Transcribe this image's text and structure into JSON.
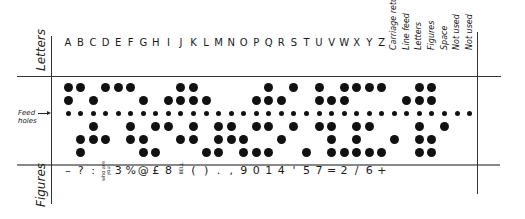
{
  "labels": {
    "letters": "Letters",
    "figures": "Figures",
    "feed_holes": "Feed holes"
  },
  "columns": [
    {
      "letter": "A",
      "figure": "–",
      "holes": [
        1,
        1,
        0,
        0,
        0
      ]
    },
    {
      "letter": "B",
      "figure": "?",
      "holes": [
        1,
        0,
        0,
        1,
        1
      ]
    },
    {
      "letter": "C",
      "figure": ":",
      "holes": [
        0,
        1,
        1,
        1,
        0
      ]
    },
    {
      "letter": "D",
      "figure": "who are you",
      "holes": [
        1,
        0,
        0,
        1,
        0
      ]
    },
    {
      "letter": "E",
      "figure": "3",
      "holes": [
        1,
        0,
        0,
        0,
        0
      ]
    },
    {
      "letter": "F",
      "figure": "%",
      "holes": [
        1,
        0,
        1,
        1,
        0
      ]
    },
    {
      "letter": "G",
      "figure": "@",
      "holes": [
        0,
        1,
        0,
        1,
        1
      ]
    },
    {
      "letter": "H",
      "figure": "£",
      "holes": [
        0,
        0,
        1,
        0,
        1
      ]
    },
    {
      "letter": "I",
      "figure": "8",
      "holes": [
        0,
        1,
        1,
        0,
        0
      ]
    },
    {
      "letter": "J",
      "figure": "BELL",
      "holes": [
        1,
        1,
        0,
        1,
        0
      ]
    },
    {
      "letter": "K",
      "figure": "(",
      "holes": [
        1,
        1,
        1,
        1,
        0
      ]
    },
    {
      "letter": "L",
      "figure": ")",
      "holes": [
        0,
        1,
        0,
        0,
        1
      ]
    },
    {
      "letter": "M",
      "figure": ".",
      "holes": [
        0,
        0,
        1,
        1,
        1
      ]
    },
    {
      "letter": "N",
      "figure": ",",
      "holes": [
        0,
        0,
        1,
        1,
        0
      ]
    },
    {
      "letter": "O",
      "figure": "9",
      "holes": [
        0,
        0,
        0,
        1,
        1
      ]
    },
    {
      "letter": "P",
      "figure": "0",
      "holes": [
        0,
        1,
        1,
        0,
        1
      ]
    },
    {
      "letter": "Q",
      "figure": "1",
      "holes": [
        1,
        1,
        1,
        0,
        1
      ]
    },
    {
      "letter": "R",
      "figure": "4",
      "holes": [
        0,
        1,
        0,
        1,
        0
      ]
    },
    {
      "letter": "S",
      "figure": "'",
      "holes": [
        1,
        0,
        1,
        0,
        0
      ]
    },
    {
      "letter": "T",
      "figure": "5",
      "holes": [
        0,
        0,
        0,
        0,
        1
      ]
    },
    {
      "letter": "U",
      "figure": "7",
      "holes": [
        1,
        1,
        1,
        0,
        0
      ]
    },
    {
      "letter": "V",
      "figure": "=",
      "holes": [
        0,
        1,
        1,
        1,
        1
      ]
    },
    {
      "letter": "W",
      "figure": "2",
      "holes": [
        1,
        1,
        0,
        0,
        1
      ]
    },
    {
      "letter": "X",
      "figure": "/",
      "holes": [
        1,
        0,
        1,
        1,
        1
      ]
    },
    {
      "letter": "Y",
      "figure": "6",
      "holes": [
        1,
        0,
        1,
        0,
        1
      ]
    },
    {
      "letter": "Z",
      "figure": "+",
      "holes": [
        1,
        0,
        0,
        0,
        1
      ]
    },
    {
      "letter": "Carriage return",
      "figure": "",
      "holes": [
        0,
        0,
        0,
        1,
        0
      ]
    },
    {
      "letter": "Line feed",
      "figure": "",
      "holes": [
        0,
        1,
        0,
        0,
        0
      ]
    },
    {
      "letter": "Letters",
      "figure": "",
      "holes": [
        1,
        1,
        1,
        1,
        1
      ]
    },
    {
      "letter": "Figures",
      "figure": "",
      "holes": [
        1,
        1,
        0,
        1,
        1
      ]
    },
    {
      "letter": "Space",
      "figure": "",
      "holes": [
        0,
        0,
        1,
        0,
        0
      ]
    },
    {
      "letter": "Not used",
      "figure": "",
      "holes": [
        0,
        0,
        0,
        0,
        0
      ]
    },
    {
      "letter": "Not used",
      "figure": "",
      "holes": [
        0,
        0,
        0,
        0,
        0
      ]
    }
  ],
  "colors": {
    "ink": "#111111",
    "paper": "#ffffff",
    "rule": "#333333"
  }
}
